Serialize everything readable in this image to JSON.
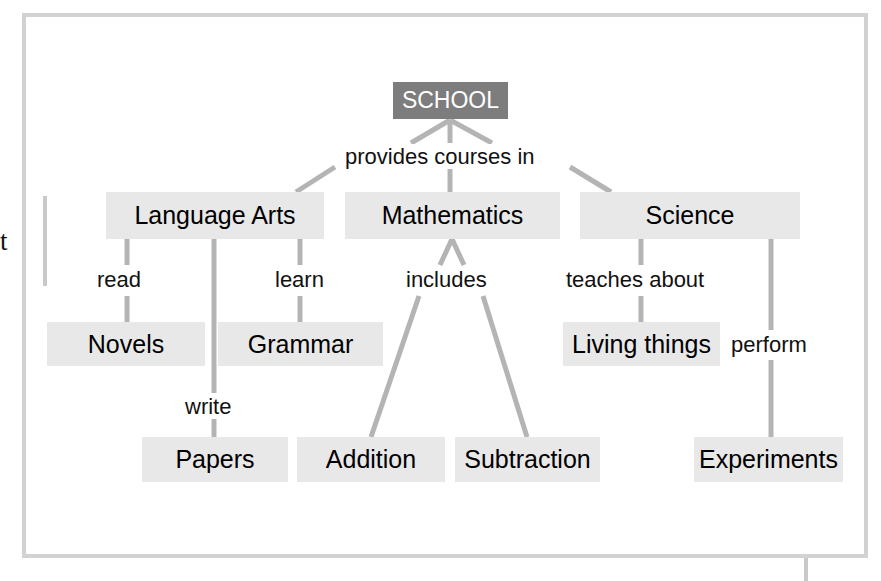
{
  "diagram": {
    "type": "concept-map",
    "root": {
      "id": "school",
      "label": "SCHOOL",
      "fill": "#7d7d7d",
      "text_color": "#ffffff"
    },
    "node_fill": "#e8e8e8",
    "node_text_color": "#000000",
    "link_color": "#b4b4b4",
    "frame_color": "#d2d2d2",
    "nodes": [
      {
        "id": "school",
        "label": "SCHOOL",
        "level": 1
      },
      {
        "id": "language-arts",
        "label": "Language Arts",
        "level": 2
      },
      {
        "id": "mathematics",
        "label": "Mathematics",
        "level": 2
      },
      {
        "id": "science",
        "label": "Science",
        "level": 2
      },
      {
        "id": "novels",
        "label": "Novels",
        "level": 3
      },
      {
        "id": "grammar",
        "label": "Grammar",
        "level": 3
      },
      {
        "id": "papers",
        "label": "Papers",
        "level": 3
      },
      {
        "id": "addition",
        "label": "Addition",
        "level": 3
      },
      {
        "id": "subtraction",
        "label": "Subtraction",
        "level": 3
      },
      {
        "id": "living-things",
        "label": "Living things",
        "level": 3
      },
      {
        "id": "experiments",
        "label": "Experiments",
        "level": 3
      }
    ],
    "links": [
      {
        "from": "school",
        "to": "language-arts",
        "label": "provides courses in"
      },
      {
        "from": "school",
        "to": "mathematics",
        "label": "provides courses in"
      },
      {
        "from": "school",
        "to": "science",
        "label": "provides courses in"
      },
      {
        "from": "language-arts",
        "to": "novels",
        "label": "read"
      },
      {
        "from": "language-arts",
        "to": "grammar",
        "label": "learn"
      },
      {
        "from": "language-arts",
        "to": "papers",
        "label": "write"
      },
      {
        "from": "mathematics",
        "to": "addition",
        "label": "includes"
      },
      {
        "from": "mathematics",
        "to": "subtraction",
        "label": "includes"
      },
      {
        "from": "science",
        "to": "living-things",
        "label": "teaches about"
      },
      {
        "from": "science",
        "to": "experiments",
        "label": "perform"
      }
    ],
    "link_labels": [
      {
        "id": "provides-courses-in",
        "text": "provides courses in"
      },
      {
        "id": "read",
        "text": "read"
      },
      {
        "id": "learn",
        "text": "learn"
      },
      {
        "id": "write",
        "text": "write"
      },
      {
        "id": "includes",
        "text": "includes"
      },
      {
        "id": "teaches-about",
        "text": "teaches about"
      },
      {
        "id": "perform",
        "text": "perform"
      }
    ],
    "margin_artifact": {
      "clipped_letter": "t"
    }
  }
}
